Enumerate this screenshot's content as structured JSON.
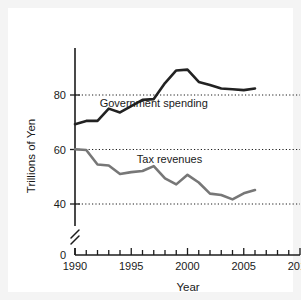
{
  "chart_data": {
    "type": "line",
    "title": "",
    "xlabel": "Year",
    "ylabel": "Trillions of Yen",
    "xlim": [
      1990,
      2010
    ],
    "ylim": [
      36,
      92
    ],
    "grid": true,
    "axis_break": true,
    "zero_label": "0",
    "legend": "inline-annotations",
    "x_major_ticks": [
      1990,
      1995,
      2000,
      2005,
      2010
    ],
    "x_tick_labels": [
      "1990",
      "1995",
      "2000",
      "2005",
      "2010"
    ],
    "x_minor_tick_step": 1,
    "y_ticks": [
      40,
      60,
      80
    ],
    "y_tick_labels": [
      "40",
      "60",
      "80"
    ],
    "series": [
      {
        "name": "Government spending",
        "color": "#222222",
        "width": 2.6,
        "label_x": 1997.0,
        "label_y": 75.5,
        "x": [
          1990,
          1991,
          1992,
          1993,
          1994,
          1995,
          1996,
          1997,
          1998,
          1999,
          2000,
          2001,
          2002,
          2003,
          2004,
          2005,
          2006
        ],
        "values": [
          69.3,
          70.5,
          70.5,
          75.0,
          73.6,
          75.9,
          78.2,
          78.5,
          84.4,
          89.0,
          89.3,
          84.8,
          83.7,
          82.4,
          82.1,
          81.8,
          82.4
        ]
      },
      {
        "name": "Tax revenues",
        "color": "#777777",
        "width": 2.6,
        "label_x": 1998.4,
        "label_y": 55.2,
        "x": [
          1990,
          1991,
          1992,
          1993,
          1994,
          1995,
          1996,
          1997,
          1998,
          1999,
          2000,
          2001,
          2002,
          2003,
          2004,
          2005,
          2006
        ],
        "values": [
          60.1,
          59.8,
          54.5,
          54.1,
          51.0,
          51.7,
          52.1,
          53.9,
          49.4,
          47.2,
          50.7,
          47.9,
          43.8,
          43.3,
          41.7,
          43.9,
          45.1
        ]
      }
    ]
  }
}
